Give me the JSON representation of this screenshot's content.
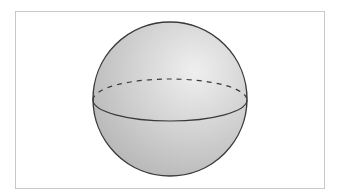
{
  "figure": {
    "colors": {
      "outline": "#3a3a3a",
      "fill_light": "#efefef",
      "fill_mid": "#d2d2d2",
      "fill_dark": "#b4b4b4",
      "frame_border": "#c8c8c8",
      "background": "#ffffff"
    },
    "sphere": {
      "cx": 170,
      "cy": 99,
      "r": 77
    },
    "equator": {
      "cx": 170,
      "cy": 100,
      "rx": 77,
      "ry": 21,
      "front_style": "solid",
      "back_style": "dashed"
    }
  }
}
